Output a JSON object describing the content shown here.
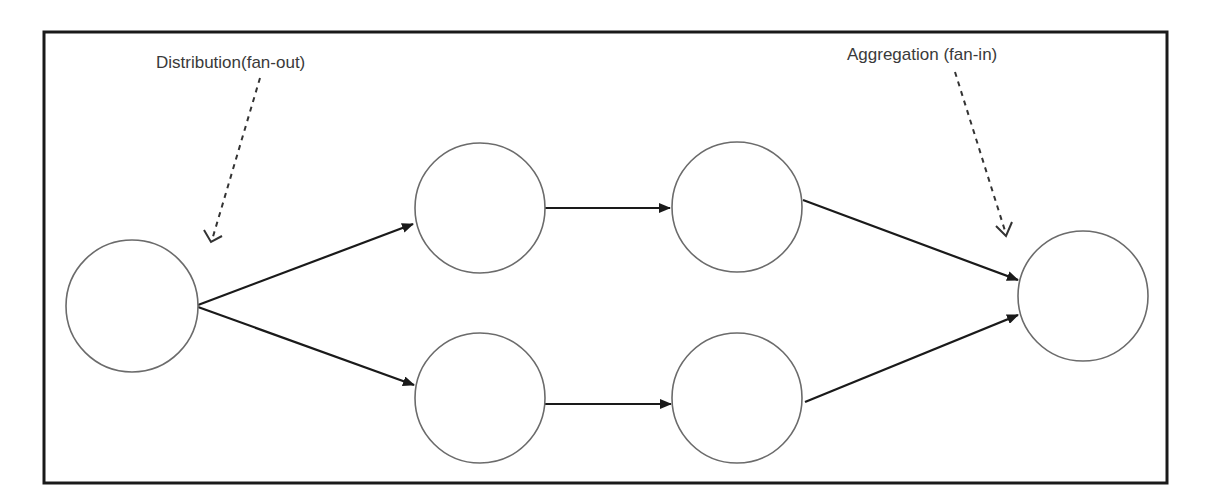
{
  "diagram": {
    "labels": {
      "distribution": "Distribution(fan-out)",
      "aggregation": "Aggregation (fan-in)"
    },
    "nodes": [
      {
        "id": "source",
        "cx": 132,
        "cy": 306,
        "r": 66
      },
      {
        "id": "top-stage-1",
        "cx": 480,
        "cy": 208,
        "r": 65
      },
      {
        "id": "top-stage-2",
        "cx": 737,
        "cy": 207,
        "r": 65
      },
      {
        "id": "bottom-stage-1",
        "cx": 480,
        "cy": 398,
        "r": 65
      },
      {
        "id": "bottom-stage-2",
        "cx": 737,
        "cy": 398,
        "r": 65
      },
      {
        "id": "sink",
        "cx": 1083,
        "cy": 296,
        "r": 65
      }
    ],
    "edges": [
      {
        "from": "source",
        "to": "top-stage-1"
      },
      {
        "from": "source",
        "to": "bottom-stage-1"
      },
      {
        "from": "top-stage-1",
        "to": "top-stage-2"
      },
      {
        "from": "bottom-stage-1",
        "to": "bottom-stage-2"
      },
      {
        "from": "top-stage-2",
        "to": "sink"
      },
      {
        "from": "bottom-stage-2",
        "to": "sink"
      }
    ],
    "colors": {
      "frame": "#1a1a1a",
      "node_stroke": "#6b6b6b",
      "edge": "#1a1a1a",
      "label": "#3a3a3a"
    }
  }
}
